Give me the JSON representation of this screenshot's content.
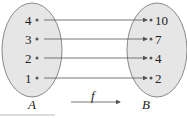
{
  "diagram": {
    "set_a": {
      "name": "A",
      "elements": [
        "4",
        "3",
        "2",
        "1"
      ]
    },
    "set_b": {
      "name": "B",
      "elements": [
        "10",
        "7",
        "4",
        "2"
      ]
    },
    "function_label": "f",
    "mappings": [
      {
        "from": "4",
        "to": "10"
      },
      {
        "from": "3",
        "to": "7"
      },
      {
        "from": "2",
        "to": "4"
      },
      {
        "from": "1",
        "to": "2"
      }
    ],
    "colors": {
      "ellipse_fill": "#e6e6e6",
      "ellipse_stroke": "#8a8a8a",
      "arrow": "#555555"
    }
  }
}
